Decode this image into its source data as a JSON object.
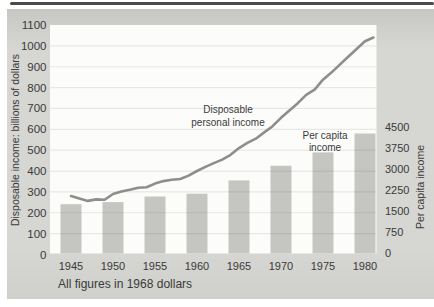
{
  "chart_data": {
    "type": "line+bar",
    "title": "",
    "footnote": "All figures in 1968 dollars",
    "grid": "horizontal",
    "left_axis": {
      "label": "Disposable income: billions of dollars",
      "min": 0,
      "max": 1100,
      "tick_step": 100,
      "ticks": [
        0,
        100,
        200,
        300,
        400,
        500,
        600,
        700,
        800,
        900,
        1000,
        1100
      ]
    },
    "right_axis": {
      "label": "Per capita income",
      "min": 0,
      "max": 4500,
      "tick_step": 750,
      "ticks": [
        0,
        750,
        1500,
        2250,
        3000,
        3750,
        4500
      ]
    },
    "x_axis": {
      "ticks": [
        1945,
        1950,
        1955,
        1960,
        1965,
        1970,
        1975,
        1980
      ]
    },
    "series": [
      {
        "name": "Disposable personal income",
        "type": "line",
        "axis": "left",
        "annotation_line1": "Disposable",
        "annotation_line2": "personal income",
        "x": [
          1945,
          1946,
          1947,
          1948,
          1949,
          1950,
          1951,
          1952,
          1953,
          1954,
          1955,
          1956,
          1957,
          1958,
          1959,
          1960,
          1961,
          1962,
          1963,
          1964,
          1965,
          1966,
          1967,
          1968,
          1969,
          1970,
          1971,
          1972,
          1973,
          1974,
          1975,
          1976,
          1977,
          1978,
          1979,
          1980,
          1981
        ],
        "values": [
          280,
          268,
          257,
          264,
          262,
          290,
          302,
          310,
          320,
          322,
          340,
          352,
          358,
          362,
          378,
          400,
          420,
          438,
          455,
          478,
          510,
          535,
          555,
          585,
          615,
          655,
          690,
          725,
          765,
          790,
          838,
          872,
          910,
          948,
          985,
          1022,
          1040
        ]
      },
      {
        "name": "Per capita income",
        "type": "bar",
        "axis": "right",
        "annotation_line1": "Per capita",
        "annotation_line2": "income",
        "x": [
          1945,
          1950,
          1955,
          1960,
          1965,
          1970,
          1975,
          1980
        ],
        "values": [
          1725,
          1800,
          2000,
          2100,
          2575,
          3100,
          3575,
          4250
        ]
      }
    ],
    "colors": {
      "bar": "#c5c6c1",
      "line": "#8e8f8c",
      "grid": "rgba(80,80,70,0.12)",
      "plot_bg": "#fcfcfa",
      "figure_bg": "#d6d6d2",
      "text": "#3a3a3a",
      "top_rule": "#4a4a48"
    }
  }
}
